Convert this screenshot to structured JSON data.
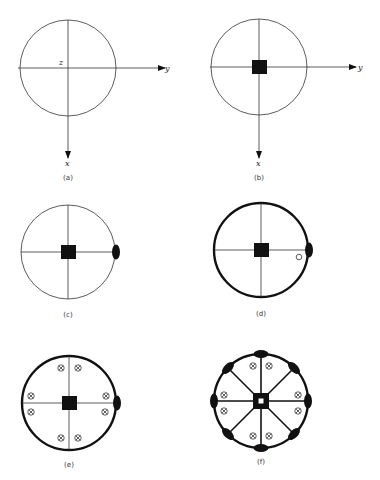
{
  "figure": {
    "panels": [
      {
        "id": "a",
        "label": "(a)",
        "center": [
          68,
          68
        ],
        "radius": 48,
        "rim": "thin",
        "axes": true,
        "origin_label": "z",
        "x_axis_label": "x",
        "y_axis_label": "y",
        "core": "none",
        "spokes": 4
      },
      {
        "id": "b",
        "label": "(b)",
        "center": [
          259,
          67
        ],
        "radius": 48,
        "rim": "thin",
        "axes": true,
        "x_axis_label": "x",
        "y_axis_label": "y",
        "core": "square",
        "spokes": 4
      },
      {
        "id": "c",
        "label": "(c)",
        "center": [
          68,
          252
        ],
        "radius": 48,
        "rim": "thin",
        "axes": false,
        "core": "square",
        "spokes": 4,
        "rim_nodes": [
          "right"
        ]
      },
      {
        "id": "d",
        "label": "(d)",
        "center": [
          260,
          250
        ],
        "radius": 48,
        "rim": "thick",
        "axes": false,
        "core": "square",
        "spokes": 4,
        "rim_nodes": [
          "right"
        ],
        "open_circle": "near-right-node"
      },
      {
        "id": "e",
        "label": "(e)",
        "center": [
          69,
          403
        ],
        "radius": 48,
        "rim": "thick",
        "axes": false,
        "core": "square",
        "spokes": 4,
        "rim_nodes": [
          "right"
        ],
        "crossed_circles": 8
      },
      {
        "id": "f",
        "label": "(f)",
        "center": [
          261,
          400
        ],
        "radius": 48,
        "rim": "thick",
        "axes": false,
        "core": "square-with-hole",
        "spokes": 8,
        "rim_nodes": 8,
        "crossed_circles": 8
      }
    ],
    "labels": {
      "a": "(a)",
      "b": "(b)",
      "c": "(c)",
      "d": "(d)",
      "e": "(e)",
      "f": "(f)",
      "z": "z",
      "x": "x",
      "y": "y"
    },
    "colors": {
      "ink": "#111111",
      "thin_line": "#333333",
      "background": "#ffffff"
    }
  }
}
